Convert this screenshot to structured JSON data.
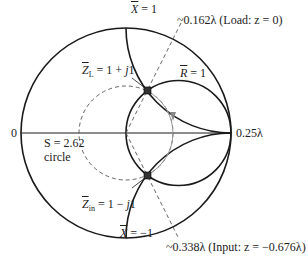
{
  "diagram": {
    "type": "smith-chart",
    "outer_circle": {
      "cx": 126,
      "cy": 133,
      "r": 105
    },
    "labels": {
      "left_end": "0",
      "right_end": "0.25λ",
      "x_pos": {
        "sym": "X",
        "eq": " = 1"
      },
      "x_neg": {
        "sym": "X",
        "eq": " = −1"
      },
      "r_one": {
        "sym": "R",
        "eq": " = 1"
      },
      "zl": {
        "sym": "Z",
        "sub": "L",
        "eq": " = 1 + ",
        "j": "j",
        "tail": "1"
      },
      "zin": {
        "sym": "Z",
        "sub": "in",
        "eq": " = 1 − ",
        "j": "j",
        "tail": "1"
      },
      "swr_line1": "S = 2.62",
      "swr_line2": "circle",
      "load": "~0.162λ (Load: z = 0)",
      "input": "~0.338λ (Input: z = −0.676λ)"
    },
    "points": {
      "load_impedance": {
        "r": 1,
        "x": 1
      },
      "input_impedance": {
        "r": 1,
        "x": -1
      }
    },
    "swr": 2.62,
    "colors": {
      "line": "#1a1a1a",
      "dashed": "#555555",
      "path": "#999999"
    }
  }
}
